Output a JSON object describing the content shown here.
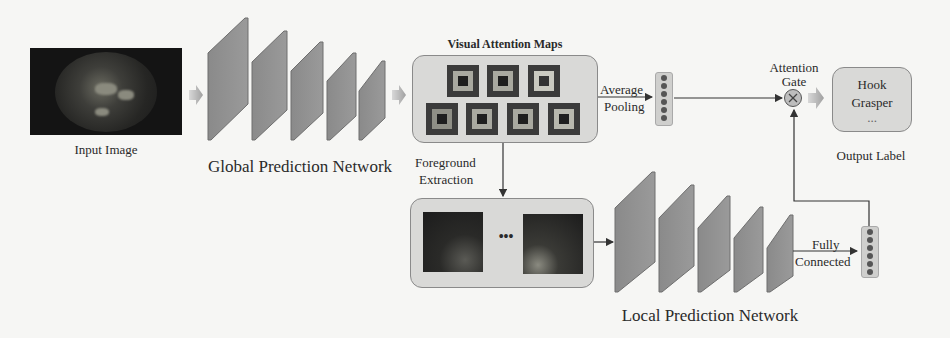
{
  "input": {
    "label": "Input Image"
  },
  "global_network": {
    "label": "Global Prediction Network",
    "layer_count": 5
  },
  "attention_maps": {
    "title": "Visual Attention Maps",
    "map_count": 7,
    "rows": [
      3,
      4
    ]
  },
  "average_pooling": {
    "line1": "Average",
    "line2": "Pooling"
  },
  "foreground": {
    "line1": "Foreground",
    "line2": "Extraction"
  },
  "local_patches": {
    "ellipsis": "•••"
  },
  "local_network": {
    "label": "Local Prediction Network",
    "layer_count": 5
  },
  "fully_connected": {
    "line1": "Fully",
    "line2": "Connected"
  },
  "attention_gate": {
    "line1": "Attention",
    "line2": "Gate",
    "symbol": "⊗"
  },
  "output": {
    "line1": "Hook",
    "line2": "Grasper",
    "ellipsis": "...",
    "label": "Output Label"
  },
  "colors": {
    "layer": "#8f8f8f",
    "layer_edge": "#6e6e6e",
    "box": "#d9d9d7",
    "line": "#333333",
    "background": "#f6f6f4"
  }
}
